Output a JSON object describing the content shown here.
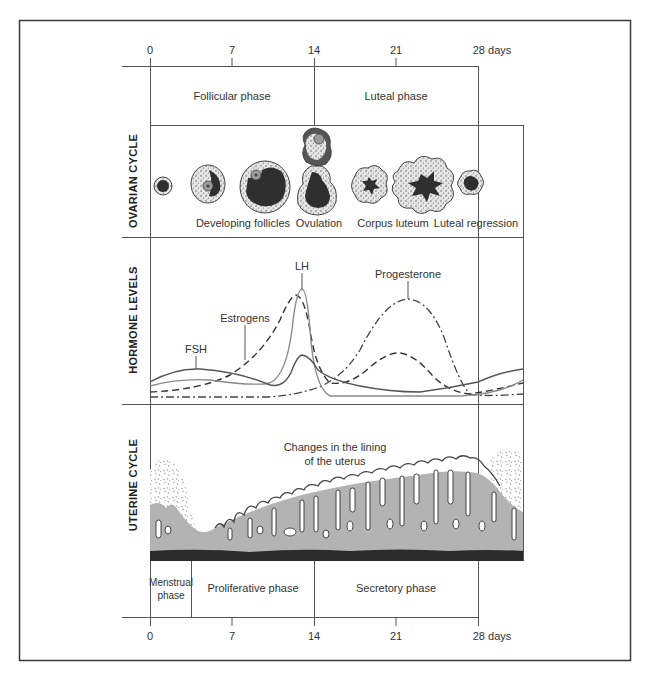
{
  "axis": {
    "ticks": [
      "0",
      "7",
      "14",
      "21",
      "28 days"
    ],
    "unit": "days"
  },
  "ovarian_phases": {
    "follicular": "Follicular phase",
    "luteal": "Luteal phase"
  },
  "rows": {
    "ovarian": "OVARIAN CYCLE",
    "hormone": "HORMONE LEVELS",
    "uterine": "UTERINE CYCLE"
  },
  "ovarian_stages": {
    "developing": "Developing follicles",
    "ovulation": "Ovulation",
    "corpus_luteum": "Corpus luteum",
    "regression": "Luteal regression"
  },
  "hormones": {
    "fsh": "FSH",
    "estrogens": "Estrogens",
    "lh": "LH",
    "progesterone": "Progesterone"
  },
  "uterine": {
    "lining_line1": "Changes in the lining",
    "lining_line2": "of the uterus"
  },
  "uterine_phases": {
    "menstrual_line1": "Menstrual",
    "menstrual_line2": "phase",
    "proliferative": "Proliferative phase",
    "secretory": "Secretory phase"
  },
  "colors": {
    "line": "#555555",
    "lh_line": "#8a8a8a",
    "lining_fill": "#b3b3b3",
    "basal_band": "#2b2b2b",
    "follicle_dark": "#2f2f2f",
    "oocyte": "#9a9a9a"
  }
}
